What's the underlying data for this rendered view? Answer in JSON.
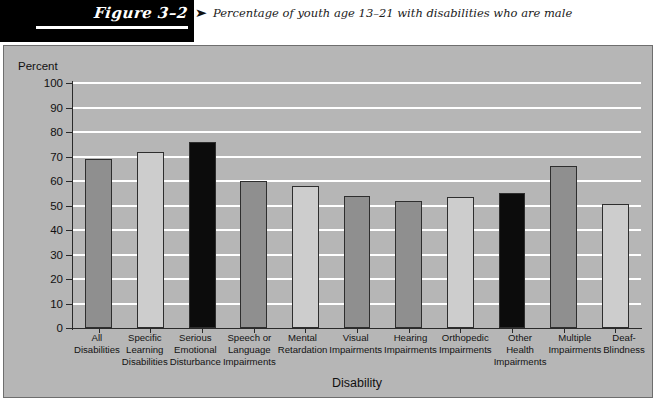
{
  "figure": {
    "number_label": "Figure 3–2",
    "caption_arrow": "➤",
    "caption": "Percentage of youth age 13–21 with disabilities who are male"
  },
  "chart_data": {
    "type": "bar",
    "title": "Percentage of youth age 13–21 with disabilities who are male",
    "xlabel": "Disability",
    "ylabel": "Percent",
    "ylim": [
      0,
      100
    ],
    "ytick_step": 10,
    "yticks": [
      "100",
      "90",
      "80",
      "70",
      "60",
      "50",
      "40",
      "30",
      "20",
      "10",
      "0"
    ],
    "grid": "horizontal-white",
    "legend": "none",
    "categories": [
      "All Disabilities",
      "Specific Learning Disabilities",
      "Serious Emotional Disturbance",
      "Speech or Language Impairments",
      "Mental Retardation",
      "Visual Impairments",
      "Hearing Impairments",
      "Orthopedic Impairments",
      "Other Health Impairments",
      "Multiple Impairments",
      "Deaf-Blindness"
    ],
    "category_lines": [
      [
        "All",
        "Disabilities"
      ],
      [
        "Specific",
        "Learning",
        "Disabilities"
      ],
      [
        "Serious",
        "Emotional",
        "Disturbance"
      ],
      [
        "Speech or",
        "Language",
        "Impairments"
      ],
      [
        "Mental",
        "Retardation"
      ],
      [
        "Visual",
        "Impairments"
      ],
      [
        "Hearing",
        "Impairments"
      ],
      [
        "Orthopedic",
        "Impairments"
      ],
      [
        "Other",
        "Health",
        "Impairments"
      ],
      [
        "Multiple",
        "Impairments"
      ],
      [
        "Deaf-",
        "Blindness"
      ]
    ],
    "values": [
      69,
      72,
      76,
      60,
      58,
      54,
      52,
      53.5,
      55,
      66,
      50.5
    ],
    "bar_colors": [
      "#8f8f8f",
      "#cdcdcd",
      "#0c0c0c",
      "#8f8f8f",
      "#cdcdcd",
      "#8f8f8f",
      "#8f8f8f",
      "#cdcdcd",
      "#0c0c0c",
      "#8f8f8f",
      "#cdcdcd"
    ]
  },
  "colors": {
    "panel_background": "#b6b6b6",
    "gridline": "#ffffff",
    "axis": "#2a2a2a",
    "header_band": "#000000",
    "bar_dark_gray": "#8f8f8f",
    "bar_light_gray": "#cdcdcd",
    "bar_black": "#0c0c0c"
  }
}
